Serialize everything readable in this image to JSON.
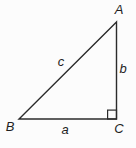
{
  "colors": {
    "background": "#fcfcfc",
    "line": "#2b2b2b",
    "label": "#1f1f1f"
  },
  "diagram": {
    "type": "right-triangle",
    "vertex_labels": {
      "top": "A",
      "bottom_left": "B",
      "bottom_right": "C"
    },
    "side_labels": {
      "hypotenuse": "c",
      "vertical": "b",
      "horizontal": "a"
    },
    "right_angle_at": "C"
  }
}
